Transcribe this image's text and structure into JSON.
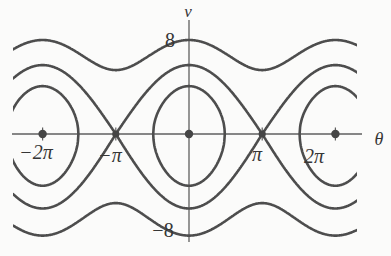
{
  "figure": {
    "background": "#fbfbfa",
    "curve_color": "#4d4d4d",
    "axis_color": "#5f5f5f",
    "dot_color": "#454545",
    "label_color": "#363636"
  },
  "labels": {
    "v": "v",
    "theta": "θ",
    "y_top": "8",
    "y_bottom": "−8",
    "x_m2pi": "−2π",
    "x_mpi": "−π",
    "x_pi": "π",
    "x_2pi": "2π"
  },
  "chart_data": {
    "type": "line",
    "subtype": "phase-portrait-ideal-pendulum",
    "xlabel": "θ",
    "ylabel": "v",
    "xlim_rad": [
      -7.55,
      7.21
    ],
    "ylim": [
      -8.6,
      8.8
    ],
    "grid": false,
    "legend": "none",
    "x_ticks": [
      {
        "label": "−2π",
        "value": -6.2832
      },
      {
        "label": "−π",
        "value": -3.1416
      },
      {
        "label": "π",
        "value": 3.1416
      },
      {
        "label": "2π",
        "value": 6.2832
      }
    ],
    "y_ticks": [
      {
        "label": "8",
        "value": 8
      },
      {
        "label": "−8",
        "value": -8
      }
    ],
    "model": {
      "equation": "v = ±sqrt(2E + 2k·cos(θ))",
      "k": 8.6
    },
    "series": [
      {
        "name": "open-rotation-upper",
        "E": 23.4,
        "branch": 1,
        "closed": false,
        "v_at_0": 8,
        "v_at_pi": 5.44
      },
      {
        "name": "open-rotation-lower",
        "E": 23.4,
        "branch": -1,
        "closed": false,
        "v_at_0": -8,
        "v_at_pi": -5.44
      },
      {
        "name": "separatrix-upper",
        "E": 8.6,
        "branch": 1,
        "closed": false,
        "v_at_0": 5.87,
        "v_at_pi": 0
      },
      {
        "name": "separatrix-lower",
        "E": 8.6,
        "branch": -1,
        "closed": false,
        "v_at_0": -5.87,
        "v_at_pi": 0
      },
      {
        "name": "closed-orbit-origin",
        "E": -0.3,
        "closed": true,
        "center": 0,
        "v_max": 4.07,
        "theta_half_width": 1.536
      },
      {
        "name": "closed-orbit-minus-2pi",
        "E": -0.3,
        "closed": true,
        "center": -6.2832,
        "v_max": 4.07,
        "theta_half_width": 1.536
      },
      {
        "name": "closed-orbit-plus-2pi",
        "E": -0.3,
        "closed": true,
        "center": 6.2832,
        "v_max": 4.07,
        "theta_half_width": 1.536
      }
    ],
    "equilibria": {
      "centers": [
        [
          -6.2832,
          0
        ],
        [
          0,
          0
        ],
        [
          6.2832,
          0
        ]
      ],
      "saddles": [
        [
          -3.1416,
          0
        ],
        [
          3.1416,
          0
        ]
      ]
    }
  }
}
